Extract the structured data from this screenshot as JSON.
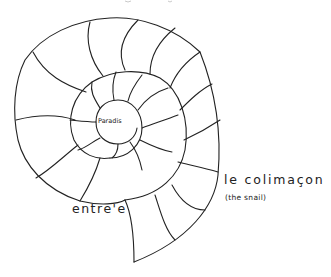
{
  "diagram": {
    "type": "spiral-shell-drawing",
    "style": "hand-drawn line art",
    "labels": {
      "center": "Paradis",
      "title": "le colimaçon",
      "subtitle": "(the snail)",
      "entry": "entre'e"
    },
    "colors": {
      "line": "#222222",
      "background": "#ffffff"
    },
    "structure": {
      "whorls": 3,
      "outer_chambers": 13,
      "inner_chambers": 10
    }
  }
}
